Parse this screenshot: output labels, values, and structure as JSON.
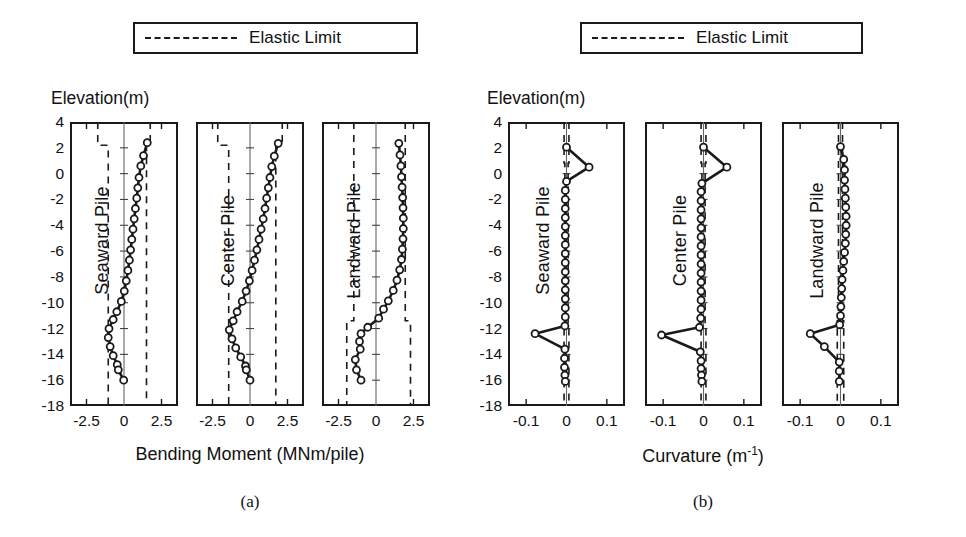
{
  "figure": {
    "background": "#ffffff",
    "line_color": "#1a1a1a",
    "marker_fill": "#ffffff",
    "dash_color": "#1a1a1a"
  },
  "legends": [
    {
      "id": "legend-a",
      "label": "Elastic Limit",
      "style": "dashed"
    },
    {
      "id": "legend-b",
      "label": "Elastic Limit",
      "style": "dashed"
    }
  ],
  "panels": [
    {
      "id": "panel-a",
      "caption": "(a)",
      "yaxis_title": "Elevation(m)",
      "xaxis_title": "Bending Moment (MNm/pile)",
      "xaxis_title_plain": "Bending Moment (MNm/pile)",
      "ylim": [
        -18,
        4
      ],
      "yticks": [
        4,
        2,
        0,
        -2,
        -4,
        -6,
        -8,
        -10,
        -12,
        -14,
        -16,
        -18
      ],
      "ytick_labels": [
        "4",
        "2",
        "0",
        "-2",
        "-4",
        "-6",
        "-8",
        "-10",
        "-12",
        "-14",
        "-16",
        "-18"
      ],
      "xlim": [
        -3.6,
        3.6
      ],
      "xticks": [
        -2.5,
        0,
        2.5
      ],
      "xtick_labels": [
        "-2.5",
        "0",
        "2.5"
      ],
      "subplots": [
        {
          "name": "Seaward Pile",
          "series_name": "Bending Moment",
          "elastic_limit_pos": [
            {
              "y_from": 4,
              "y_to": 2.2,
              "x": 1.75
            },
            {
              "y_from": 2.2,
              "y_to": -18,
              "x": 1.5
            }
          ],
          "elastic_limit_neg": [
            {
              "y_from": 4,
              "y_to": 2.2,
              "x": -1.75
            },
            {
              "y_from": 2.2,
              "y_to": -18,
              "x": -1.05
            }
          ],
          "points": [
            {
              "y": 2.4,
              "x": 1.55
            },
            {
              "y": 1.4,
              "x": 1.3
            },
            {
              "y": 0.6,
              "x": 1.12
            },
            {
              "y": -0.3,
              "x": 1.0
            },
            {
              "y": -1.1,
              "x": 0.92
            },
            {
              "y": -1.9,
              "x": 0.85
            },
            {
              "y": -2.7,
              "x": 0.76
            },
            {
              "y": -3.5,
              "x": 0.68
            },
            {
              "y": -4.3,
              "x": 0.6
            },
            {
              "y": -5.1,
              "x": 0.52
            },
            {
              "y": -5.9,
              "x": 0.44
            },
            {
              "y": -6.7,
              "x": 0.36
            },
            {
              "y": -7.5,
              "x": 0.26
            },
            {
              "y": -8.3,
              "x": 0.15
            },
            {
              "y": -9.1,
              "x": 0.02
            },
            {
              "y": -9.9,
              "x": -0.18
            },
            {
              "y": -10.7,
              "x": -0.48
            },
            {
              "y": -11.3,
              "x": -0.72
            },
            {
              "y": -12.0,
              "x": -1.0
            },
            {
              "y": -12.7,
              "x": -1.05
            },
            {
              "y": -13.4,
              "x": -0.92
            },
            {
              "y": -14.1,
              "x": -0.72
            },
            {
              "y": -14.8,
              "x": -0.45
            },
            {
              "y": -15.2,
              "x": -0.38
            },
            {
              "y": -16.0,
              "x": -0.02
            }
          ]
        },
        {
          "name": "Center Pile",
          "series_name": "Bending Moment",
          "elastic_limit_pos": [
            {
              "y_from": 4,
              "y_to": 2.2,
              "x": 2.15
            },
            {
              "y_from": 2.2,
              "y_to": -18,
              "x": 1.72
            }
          ],
          "elastic_limit_neg": [
            {
              "y_from": 4,
              "y_to": 2.2,
              "x": -2.15
            },
            {
              "y_from": 2.2,
              "y_to": -18,
              "x": -1.42
            }
          ],
          "points": [
            {
              "y": 2.35,
              "x": 1.88
            },
            {
              "y": 1.35,
              "x": 1.62
            },
            {
              "y": 0.55,
              "x": 1.45
            },
            {
              "y": -0.3,
              "x": 1.33
            },
            {
              "y": -1.1,
              "x": 1.22
            },
            {
              "y": -1.9,
              "x": 1.11
            },
            {
              "y": -2.7,
              "x": 1.0
            },
            {
              "y": -3.5,
              "x": 0.88
            },
            {
              "y": -4.3,
              "x": 0.74
            },
            {
              "y": -5.1,
              "x": 0.6
            },
            {
              "y": -5.9,
              "x": 0.46
            },
            {
              "y": -6.7,
              "x": 0.3
            },
            {
              "y": -7.5,
              "x": 0.14
            },
            {
              "y": -8.3,
              "x": -0.04
            },
            {
              "y": -9.1,
              "x": -0.26
            },
            {
              "y": -9.9,
              "x": -0.52
            },
            {
              "y": -10.7,
              "x": -0.86
            },
            {
              "y": -11.4,
              "x": -1.12
            },
            {
              "y": -12.1,
              "x": -1.38
            },
            {
              "y": -12.8,
              "x": -1.2
            },
            {
              "y": -13.5,
              "x": -0.95
            },
            {
              "y": -14.2,
              "x": -0.62
            },
            {
              "y": -14.9,
              "x": -0.3
            },
            {
              "y": -15.2,
              "x": -0.25
            },
            {
              "y": -16.0,
              "x": 0.0
            }
          ]
        },
        {
          "name": "Landward Pile",
          "series_name": "Bending Moment",
          "elastic_limit_pos": [
            {
              "y_from": 4,
              "y_to": -11.4,
              "x": 1.95
            },
            {
              "y_from": -11.4,
              "y_to": -18,
              "x": 2.3
            }
          ],
          "elastic_limit_neg": [
            {
              "y_from": 4,
              "y_to": -11.4,
              "x": -1.48
            },
            {
              "y_from": -11.4,
              "y_to": -18,
              "x": -1.95
            }
          ],
          "points": [
            {
              "y": 2.35,
              "x": 1.52
            },
            {
              "y": 1.45,
              "x": 1.6
            },
            {
              "y": 0.6,
              "x": 1.66
            },
            {
              "y": -0.25,
              "x": 1.7
            },
            {
              "y": -1.05,
              "x": 1.74
            },
            {
              "y": -1.85,
              "x": 1.78
            },
            {
              "y": -2.65,
              "x": 1.8
            },
            {
              "y": -3.45,
              "x": 1.82
            },
            {
              "y": -4.25,
              "x": 1.82
            },
            {
              "y": -5.05,
              "x": 1.8
            },
            {
              "y": -5.85,
              "x": 1.76
            },
            {
              "y": -6.65,
              "x": 1.7
            },
            {
              "y": -7.45,
              "x": 1.58
            },
            {
              "y": -8.25,
              "x": 1.4
            },
            {
              "y": -9.05,
              "x": 1.15
            },
            {
              "y": -9.85,
              "x": 0.82
            },
            {
              "y": -10.5,
              "x": 0.5
            },
            {
              "y": -11.2,
              "x": 0.18
            },
            {
              "y": -11.9,
              "x": -0.55
            },
            {
              "y": -12.4,
              "x": -1.0
            },
            {
              "y": -13.0,
              "x": -1.1
            },
            {
              "y": -13.6,
              "x": -1.05
            },
            {
              "y": -14.4,
              "x": -1.38
            },
            {
              "y": -15.2,
              "x": -1.3
            },
            {
              "y": -16.0,
              "x": -1.0
            }
          ]
        }
      ]
    },
    {
      "id": "panel-b",
      "caption": "(b)",
      "yaxis_title": "Elevation(m)",
      "xaxis_title": "Curvature (m",
      "xaxis_title_sup": "-1",
      "xaxis_title_tail": ")",
      "xaxis_title_plain": "Curvature (m-1)",
      "ylim": [
        -18,
        4
      ],
      "yticks": [
        4,
        2,
        0,
        -2,
        -4,
        -6,
        -8,
        -10,
        -12,
        -14,
        -16,
        -18
      ],
      "ytick_labels": [
        "4",
        "2",
        "0",
        "-2",
        "-4",
        "-6",
        "-8",
        "-10",
        "-12",
        "-14",
        "-16",
        "-18"
      ],
      "xlim": [
        -0.145,
        0.145
      ],
      "xticks": [
        -0.1,
        0,
        0.1
      ],
      "xtick_labels": [
        "-0.1",
        "0",
        "0.1"
      ],
      "subplots": [
        {
          "name": "Seaward Pile",
          "series_name": "Curvature",
          "elastic_limit_pos": [
            {
              "y_from": 4,
              "y_to": 0.8,
              "x": 0.006
            },
            {
              "y_from": 0.8,
              "y_to": -11.6,
              "x": 0.004
            },
            {
              "y_from": -11.6,
              "y_to": -18,
              "x": 0.006
            }
          ],
          "elastic_limit_neg": [
            {
              "y_from": 4,
              "y_to": 0.8,
              "x": -0.006
            },
            {
              "y_from": 0.8,
              "y_to": -11.6,
              "x": -0.004
            },
            {
              "y_from": -11.6,
              "y_to": -18,
              "x": -0.006
            }
          ],
          "points": [
            {
              "y": 2.05,
              "x": 0.0
            },
            {
              "y": 0.5,
              "x": 0.056
            },
            {
              "y": -0.6,
              "x": 0.0
            },
            {
              "y": -1.3,
              "x": -0.003
            },
            {
              "y": -2.0,
              "x": -0.003
            },
            {
              "y": -2.7,
              "x": -0.003
            },
            {
              "y": -3.4,
              "x": -0.003
            },
            {
              "y": -4.1,
              "x": -0.003
            },
            {
              "y": -4.8,
              "x": -0.003
            },
            {
              "y": -5.5,
              "x": -0.003
            },
            {
              "y": -6.2,
              "x": -0.003
            },
            {
              "y": -6.9,
              "x": -0.003
            },
            {
              "y": -7.6,
              "x": -0.003
            },
            {
              "y": -8.3,
              "x": -0.003
            },
            {
              "y": -9.0,
              "x": -0.003
            },
            {
              "y": -9.7,
              "x": -0.003
            },
            {
              "y": -10.4,
              "x": -0.003
            },
            {
              "y": -11.1,
              "x": -0.003
            },
            {
              "y": -11.8,
              "x": -0.004
            },
            {
              "y": -12.4,
              "x": -0.078
            },
            {
              "y": -13.6,
              "x": -0.004
            },
            {
              "y": -14.3,
              "x": -0.005
            },
            {
              "y": -15.0,
              "x": -0.005
            },
            {
              "y": -15.6,
              "x": -0.004
            },
            {
              "y": -16.1,
              "x": -0.003
            }
          ]
        },
        {
          "name": "Center Pile",
          "series_name": "Curvature",
          "elastic_limit_pos": [
            {
              "y_from": 4,
              "y_to": 0.8,
              "x": 0.006
            },
            {
              "y_from": 0.8,
              "y_to": -11.6,
              "x": 0.004
            },
            {
              "y_from": -11.6,
              "y_to": -18,
              "x": 0.006
            }
          ],
          "elastic_limit_neg": [
            {
              "y_from": 4,
              "y_to": 0.8,
              "x": -0.006
            },
            {
              "y_from": 0.8,
              "y_to": -11.6,
              "x": -0.004
            },
            {
              "y_from": -11.6,
              "y_to": -18,
              "x": -0.006
            }
          ],
          "points": [
            {
              "y": 2.05,
              "x": 0.0
            },
            {
              "y": 0.5,
              "x": 0.058
            },
            {
              "y": -0.75,
              "x": -0.004
            },
            {
              "y": -1.4,
              "x": -0.006
            },
            {
              "y": -2.1,
              "x": -0.006
            },
            {
              "y": -2.8,
              "x": -0.006
            },
            {
              "y": -3.5,
              "x": -0.006
            },
            {
              "y": -4.2,
              "x": -0.006
            },
            {
              "y": -4.9,
              "x": -0.006
            },
            {
              "y": -5.6,
              "x": -0.006
            },
            {
              "y": -6.3,
              "x": -0.006
            },
            {
              "y": -7.0,
              "x": -0.006
            },
            {
              "y": -7.7,
              "x": -0.006
            },
            {
              "y": -8.4,
              "x": -0.006
            },
            {
              "y": -9.1,
              "x": -0.006
            },
            {
              "y": -9.8,
              "x": -0.006
            },
            {
              "y": -10.5,
              "x": -0.006
            },
            {
              "y": -11.2,
              "x": -0.007
            },
            {
              "y": -11.9,
              "x": -0.01
            },
            {
              "y": -12.5,
              "x": -0.104
            },
            {
              "y": -13.8,
              "x": -0.008
            },
            {
              "y": -14.5,
              "x": -0.006
            },
            {
              "y": -15.1,
              "x": -0.006
            },
            {
              "y": -15.6,
              "x": -0.005
            },
            {
              "y": -16.1,
              "x": -0.004
            }
          ]
        },
        {
          "name": "Landward Pile",
          "series_name": "Curvature",
          "elastic_limit_pos": [
            {
              "y_from": 4,
              "y_to": -11.4,
              "x": 0.005
            },
            {
              "y_from": -11.4,
              "y_to": -18,
              "x": 0.008
            }
          ],
          "elastic_limit_neg": [
            {
              "y_from": 4,
              "y_to": -11.4,
              "x": -0.005
            },
            {
              "y_from": -11.4,
              "y_to": -18,
              "x": -0.008
            }
          ],
          "points": [
            {
              "y": 2.1,
              "x": 0.0
            },
            {
              "y": 1.1,
              "x": 0.008
            },
            {
              "y": 0.3,
              "x": 0.01
            },
            {
              "y": -0.5,
              "x": 0.01
            },
            {
              "y": -1.2,
              "x": 0.011
            },
            {
              "y": -1.9,
              "x": 0.012
            },
            {
              "y": -2.6,
              "x": 0.013
            },
            {
              "y": -3.3,
              "x": 0.014
            },
            {
              "y": -4.0,
              "x": 0.014
            },
            {
              "y": -4.7,
              "x": 0.013
            },
            {
              "y": -5.4,
              "x": 0.012
            },
            {
              "y": -6.1,
              "x": 0.01
            },
            {
              "y": -6.8,
              "x": 0.008
            },
            {
              "y": -7.5,
              "x": 0.006
            },
            {
              "y": -8.2,
              "x": 0.004
            },
            {
              "y": -8.9,
              "x": 0.003
            },
            {
              "y": -9.6,
              "x": 0.002
            },
            {
              "y": -10.3,
              "x": 0.001
            },
            {
              "y": -11.0,
              "x": 0.0
            },
            {
              "y": -11.7,
              "x": -0.002
            },
            {
              "y": -12.4,
              "x": -0.075
            },
            {
              "y": -13.4,
              "x": -0.04
            },
            {
              "y": -14.6,
              "x": -0.003
            },
            {
              "y": -15.3,
              "x": -0.003
            },
            {
              "y": -16.1,
              "x": -0.003
            }
          ]
        }
      ]
    }
  ]
}
